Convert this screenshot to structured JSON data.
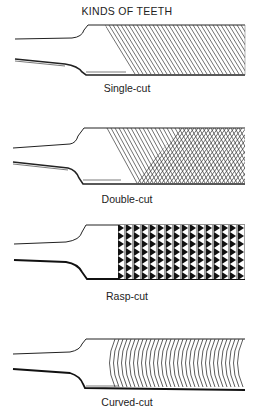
{
  "title": "KINDS OF TEETH",
  "files": [
    {
      "caption": "Single-cut",
      "pattern": "single"
    },
    {
      "caption": "Double-cut",
      "pattern": "double"
    },
    {
      "caption": "Rasp-cut",
      "pattern": "rasp"
    },
    {
      "caption": "Curved-cut",
      "pattern": "curved"
    }
  ]
}
